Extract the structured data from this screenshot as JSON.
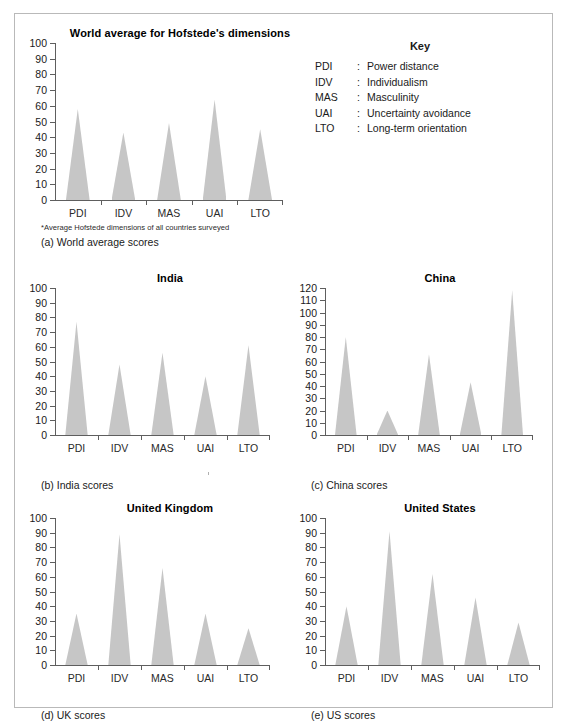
{
  "key": {
    "title": "Key",
    "entries": [
      {
        "abbr": "PDI",
        "sep": ":",
        "desc": "Power distance"
      },
      {
        "abbr": "IDV",
        "sep": ":",
        "desc": "Individualism"
      },
      {
        "abbr": "MAS",
        "sep": ":",
        "desc": "Masculinity"
      },
      {
        "abbr": "UAI",
        "sep": ":",
        "desc": "Uncertainty avoidance"
      },
      {
        "abbr": "LTO",
        "sep": ":",
        "desc": "Long-term orientation"
      }
    ]
  },
  "figures": [
    {
      "id": "world",
      "title": "World average for Hofstede's dimensions",
      "caption": "(a) World average scores",
      "footnote": "*Average Hofstede dimensions of all countries surveyed"
    },
    {
      "id": "india",
      "title": "India",
      "caption": "(b) India scores"
    },
    {
      "id": "china",
      "title": "China",
      "caption": "(c) China scores"
    },
    {
      "id": "uk",
      "title": "United Kingdom",
      "caption": "(d) UK scores"
    },
    {
      "id": "us",
      "title": "United States",
      "caption": "(e) US scores"
    }
  ],
  "chart_data": [
    {
      "type": "bar",
      "title": "World average for Hofstede's dimensions",
      "categories": [
        "PDI",
        "IDV",
        "MAS",
        "UAI",
        "LTO"
      ],
      "values": [
        58,
        43,
        49,
        64,
        45
      ],
      "xlabel": "",
      "ylabel": "",
      "ylim": [
        0,
        100
      ],
      "yticks": [
        0,
        10,
        20,
        30,
        40,
        50,
        60,
        70,
        80,
        90,
        100
      ],
      "grid": false,
      "legend": "none"
    },
    {
      "type": "bar",
      "title": "India",
      "categories": [
        "PDI",
        "IDV",
        "MAS",
        "UAI",
        "LTO"
      ],
      "values": [
        77,
        48,
        56,
        40,
        61
      ],
      "xlabel": "",
      "ylabel": "",
      "ylim": [
        0,
        100
      ],
      "yticks": [
        0,
        10,
        20,
        30,
        40,
        50,
        60,
        70,
        80,
        90,
        100
      ],
      "grid": false,
      "legend": "none"
    },
    {
      "type": "bar",
      "title": "China",
      "categories": [
        "PDI",
        "IDV",
        "MAS",
        "UAI",
        "LTO"
      ],
      "values": [
        80,
        20,
        66,
        43,
        118
      ],
      "xlabel": "",
      "ylabel": "",
      "ylim": [
        0,
        120
      ],
      "yticks": [
        0,
        10,
        20,
        30,
        40,
        50,
        60,
        70,
        80,
        90,
        100,
        110,
        120
      ],
      "grid": false,
      "legend": "none"
    },
    {
      "type": "bar",
      "title": "United Kingdom",
      "categories": [
        "PDI",
        "IDV",
        "MAS",
        "UAI",
        "LTO"
      ],
      "values": [
        35,
        89,
        66,
        35,
        25
      ],
      "xlabel": "",
      "ylabel": "",
      "ylim": [
        0,
        100
      ],
      "yticks": [
        0,
        10,
        20,
        30,
        40,
        50,
        60,
        70,
        80,
        90,
        100
      ],
      "grid": false,
      "legend": "none"
    },
    {
      "type": "bar",
      "title": "United States",
      "categories": [
        "PDI",
        "IDV",
        "MAS",
        "UAI",
        "LTO"
      ],
      "values": [
        40,
        91,
        62,
        46,
        29
      ],
      "xlabel": "",
      "ylabel": "",
      "ylim": [
        0,
        100
      ],
      "yticks": [
        0,
        10,
        20,
        30,
        40,
        50,
        60,
        70,
        80,
        90,
        100
      ],
      "grid": false,
      "legend": "none"
    }
  ],
  "style": {
    "spike_color": "#c6c6c6",
    "axis_color": "#5e5e5e",
    "frame_color": "#b9b9b9",
    "text_color": "#1a1a1a",
    "background": "#ffffff"
  }
}
